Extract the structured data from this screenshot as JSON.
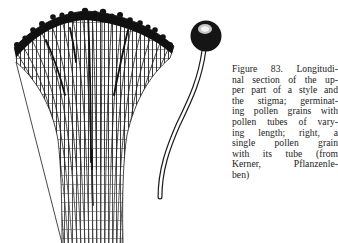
{
  "figure": {
    "number": "Figure 83.",
    "caption_lines": [
      "Figure 83. Longitudi-",
      "nal section of the up-",
      "per part of a style and",
      "the stigma; germinat-",
      "ing pollen grains with",
      "pollen tubes of vary-",
      "ing length; right, a",
      "single pollen grain",
      "with its tube (from",
      "Kerner, Pflanzenle-",
      "ben)"
    ],
    "caption_full": "Figure 83. Longitudinal section of the upper part of a style and the stigma; germinating pollen grains with pollen tubes of varying length; right, a single pollen grain with its tube (from Kerner, Pflanzenleben)",
    "illustrations": [
      {
        "name": "style-and-stigma-section",
        "description": "Longitudinal section of the upper part of a style and the stigma with germinating pollen grains"
      },
      {
        "name": "single-pollen-grain",
        "description": "Single pollen grain with its tube"
      }
    ],
    "colors": {
      "ink": "#1a1a1a",
      "paper": "#ffffff"
    }
  }
}
